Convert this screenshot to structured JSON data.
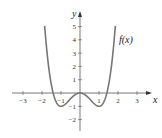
{
  "chart_data": {
    "type": "line",
    "title": "",
    "xlabel": "x",
    "ylabel": "y",
    "xlim": [
      -3.2,
      3.5
    ],
    "ylim": [
      -2.7,
      6.0
    ],
    "grid": false,
    "legend": null,
    "x_ticks": [
      "−3",
      "−2",
      "−1",
      "1",
      "2",
      "3"
    ],
    "y_ticks": [
      "−2",
      "−1",
      "1",
      "2",
      "3",
      "4",
      "5"
    ],
    "series": [
      {
        "name": "f(x)",
        "function": "x^4 - 2x^2",
        "x": [
          -1.86,
          -1.5,
          -1.41,
          -1,
          -0.5,
          0,
          0.5,
          1,
          1.41,
          1.5,
          1.86
        ],
        "values": [
          5.0,
          0.56,
          0,
          -1,
          -0.44,
          0,
          -0.44,
          -1,
          0,
          0.56,
          5.0
        ]
      }
    ],
    "annotations": [
      {
        "text": "f(x)",
        "x": 2.0,
        "y": 4.0
      }
    ]
  },
  "labels": {
    "x_axis": "x",
    "y_axis": "y",
    "curve": "f(x)"
  }
}
